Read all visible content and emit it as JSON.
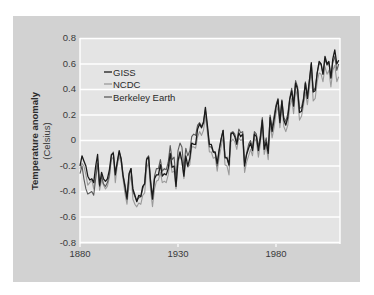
{
  "chart_data": {
    "type": "line",
    "title": "",
    "xlabel": "",
    "ylabel": "Temperature anomaly",
    "ylabel_sub": "(Celsius)",
    "xlim": [
      1880,
      2012
    ],
    "ylim": [
      -0.8,
      0.8
    ],
    "x_ticks": [
      1880,
      1930,
      1980
    ],
    "y_ticks": [
      0.8,
      0.6,
      0.4,
      0.2,
      0,
      -0.2,
      -0.4,
      -0.6,
      -0.8
    ],
    "y_tick_labels": [
      "0.8",
      "0.6",
      "0.4",
      "0.2",
      "0",
      "-0.2",
      "-0.4",
      "-0.6",
      "-0.8"
    ],
    "grid": true,
    "legend_position": "upper-left",
    "x_start": 1880,
    "series": [
      {
        "name": "GISS",
        "color": "#1a1a1a",
        "values": [
          -0.2,
          -0.12,
          -0.16,
          -0.2,
          -0.28,
          -0.31,
          -0.3,
          -0.33,
          -0.2,
          -0.11,
          -0.35,
          -0.25,
          -0.3,
          -0.32,
          -0.3,
          -0.23,
          -0.11,
          -0.1,
          -0.27,
          -0.17,
          -0.08,
          -0.15,
          -0.28,
          -0.37,
          -0.46,
          -0.26,
          -0.22,
          -0.38,
          -0.43,
          -0.48,
          -0.43,
          -0.44,
          -0.36,
          -0.34,
          -0.15,
          -0.13,
          -0.33,
          -0.46,
          -0.3,
          -0.27,
          -0.27,
          -0.19,
          -0.28,
          -0.26,
          -0.27,
          -0.22,
          -0.1,
          -0.21,
          -0.2,
          -0.36,
          -0.16,
          -0.09,
          -0.16,
          -0.28,
          -0.12,
          -0.2,
          -0.14,
          -0.02,
          -0.03,
          -0.03,
          0.09,
          0.13,
          0.1,
          0.14,
          0.26,
          0.12,
          -0.03,
          -0.03,
          -0.09,
          -0.09,
          -0.18,
          -0.07,
          0.01,
          0.08,
          -0.13,
          -0.14,
          -0.19,
          0.05,
          0.06,
          0.03,
          -0.03,
          0.06,
          0.03,
          0.05,
          -0.2,
          -0.11,
          -0.06,
          -0.02,
          -0.08,
          0.05,
          0.03,
          -0.08,
          0.01,
          0.16,
          -0.07,
          -0.01,
          -0.1,
          0.18,
          0.07,
          0.16,
          0.26,
          0.32,
          0.14,
          0.31,
          0.16,
          0.12,
          0.18,
          0.32,
          0.39,
          0.27,
          0.45,
          0.4,
          0.22,
          0.23,
          0.31,
          0.45,
          0.33,
          0.46,
          0.61,
          0.38,
          0.39,
          0.53,
          0.62,
          0.6,
          0.52,
          0.66,
          0.6,
          0.62,
          0.49,
          0.64,
          0.71,
          0.6,
          0.63
        ]
      },
      {
        "name": "NCDC",
        "color": "#9a9a9a",
        "values": [
          -0.22,
          -0.18,
          -0.2,
          -0.27,
          -0.35,
          -0.33,
          -0.31,
          -0.38,
          -0.26,
          -0.15,
          -0.39,
          -0.31,
          -0.35,
          -0.38,
          -0.36,
          -0.29,
          -0.15,
          -0.13,
          -0.33,
          -0.2,
          -0.12,
          -0.18,
          -0.31,
          -0.42,
          -0.5,
          -0.35,
          -0.27,
          -0.46,
          -0.5,
          -0.52,
          -0.49,
          -0.5,
          -0.43,
          -0.41,
          -0.22,
          -0.17,
          -0.39,
          -0.52,
          -0.38,
          -0.32,
          -0.31,
          -0.25,
          -0.33,
          -0.32,
          -0.33,
          -0.27,
          -0.15,
          -0.25,
          -0.24,
          -0.38,
          -0.17,
          -0.12,
          -0.16,
          -0.3,
          -0.16,
          -0.21,
          -0.19,
          -0.05,
          -0.05,
          -0.06,
          0.03,
          0.07,
          0.04,
          0.08,
          0.19,
          0.06,
          -0.09,
          -0.09,
          -0.14,
          -0.13,
          -0.24,
          -0.13,
          -0.05,
          0.03,
          -0.19,
          -0.2,
          -0.27,
          -0.01,
          0.01,
          -0.01,
          -0.07,
          0.02,
          0.0,
          0.01,
          -0.25,
          -0.17,
          -0.12,
          -0.07,
          -0.12,
          0.02,
          -0.01,
          -0.13,
          -0.03,
          0.12,
          -0.11,
          -0.04,
          -0.15,
          0.13,
          0.02,
          0.1,
          0.21,
          0.27,
          0.1,
          0.27,
          0.11,
          0.07,
          0.12,
          0.26,
          0.33,
          0.21,
          0.4,
          0.34,
          0.16,
          0.19,
          0.27,
          0.38,
          0.28,
          0.4,
          0.55,
          0.31,
          0.33,
          0.46,
          0.53,
          0.52,
          0.46,
          0.58,
          0.52,
          0.55,
          0.42,
          0.55,
          0.59,
          0.46,
          0.5
        ]
      },
      {
        "name": "Berkeley Earth",
        "color": "#5a5a5a",
        "values": [
          -0.26,
          -0.2,
          -0.3,
          -0.38,
          -0.42,
          -0.41,
          -0.4,
          -0.43,
          -0.3,
          -0.18,
          -0.36,
          -0.28,
          -0.34,
          -0.36,
          -0.33,
          -0.27,
          -0.12,
          -0.09,
          -0.25,
          -0.18,
          -0.09,
          -0.14,
          -0.27,
          -0.35,
          -0.44,
          -0.28,
          -0.22,
          -0.4,
          -0.44,
          -0.47,
          -0.45,
          -0.44,
          -0.38,
          -0.33,
          -0.14,
          -0.12,
          -0.31,
          -0.44,
          -0.28,
          -0.22,
          -0.22,
          -0.15,
          -0.24,
          -0.22,
          -0.23,
          -0.17,
          -0.04,
          -0.15,
          -0.13,
          -0.3,
          -0.08,
          -0.02,
          -0.05,
          -0.22,
          -0.06,
          -0.12,
          -0.08,
          0.03,
          0.05,
          0.04,
          0.12,
          0.14,
          0.11,
          0.15,
          0.24,
          0.1,
          -0.05,
          -0.05,
          -0.09,
          -0.1,
          -0.2,
          -0.08,
          0.01,
          0.08,
          -0.14,
          -0.13,
          -0.2,
          0.06,
          0.07,
          0.05,
          -0.01,
          0.09,
          0.06,
          0.07,
          -0.18,
          -0.1,
          -0.03,
          0.0,
          -0.06,
          0.07,
          0.05,
          -0.05,
          0.04,
          0.18,
          -0.04,
          0.02,
          -0.08,
          0.2,
          0.1,
          0.19,
          0.28,
          0.33,
          0.16,
          0.32,
          0.18,
          0.15,
          0.21,
          0.33,
          0.41,
          0.3,
          0.47,
          0.42,
          0.25,
          0.26,
          0.33,
          0.46,
          0.35,
          0.47,
          0.6,
          0.39,
          0.41,
          0.53,
          0.6,
          0.6,
          0.52,
          0.64,
          0.59,
          0.61,
          0.49,
          0.61,
          0.66,
          0.55,
          0.6
        ]
      }
    ]
  },
  "axis": {
    "y_title": "Temperature anomaly",
    "y_subtitle": "(Celsius)",
    "x_labels": [
      "1880",
      "1930",
      "1980"
    ],
    "y_labels": [
      "0.8",
      "0.6",
      "0.4",
      "0.2",
      "0",
      "-0.2",
      "-0.4",
      "-0.6",
      "-0.8"
    ]
  },
  "legend": {
    "items": [
      {
        "label": "GISS",
        "color": "#1a1a1a"
      },
      {
        "label": "NCDC",
        "color": "#9a9a9a"
      },
      {
        "label": "Berkeley Earth",
        "color": "#5a5a5a"
      }
    ]
  },
  "colors": {
    "panel": "#d2d2d2",
    "plot_bg": "#e4e4e4",
    "grid": "#ffffff"
  }
}
